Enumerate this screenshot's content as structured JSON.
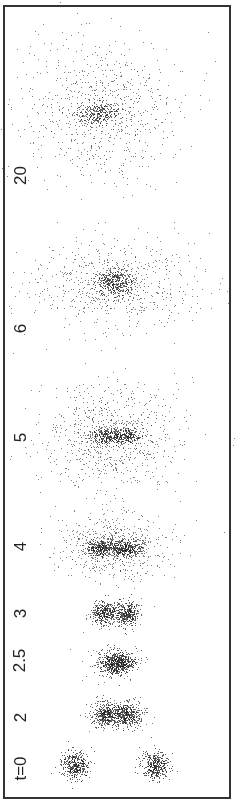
{
  "figure": {
    "frame_color": "#333333",
    "dot_color": "#1a1a1a"
  },
  "chart_data": {
    "type": "scatter",
    "title": "",
    "xlabel": "",
    "ylabel": "",
    "grid": false,
    "panels": [
      {
        "label": "t=0",
        "label_pos": [
          20,
          768
        ],
        "blobs": [
          {
            "cx": 75,
            "cy": 765,
            "sx": 7,
            "sy": 7,
            "n": 380
          },
          {
            "cx": 155,
            "cy": 765,
            "sx": 7,
            "sy": 7,
            "n": 380
          }
        ],
        "halo": {
          "cx": 115,
          "cy": 765,
          "sx": 8,
          "sy": 8,
          "n": 0
        }
      },
      {
        "label": "2",
        "label_pos": [
          20,
          717
        ],
        "blobs": [
          {
            "cx": 106,
            "cy": 714,
            "sx": 7,
            "sy": 6,
            "n": 380
          },
          {
            "cx": 126,
            "cy": 714,
            "sx": 7,
            "sy": 6,
            "n": 380
          }
        ],
        "halo": {
          "cx": 116,
          "cy": 714,
          "sx": 16,
          "sy": 9,
          "n": 60
        }
      },
      {
        "label": "2.5",
        "label_pos": [
          20,
          660
        ],
        "blobs": [
          {
            "cx": 116,
            "cy": 663,
            "sx": 9,
            "sy": 6,
            "n": 650
          }
        ],
        "halo": {
          "cx": 116,
          "cy": 663,
          "sx": 14,
          "sy": 9,
          "n": 60
        }
      },
      {
        "label": "3",
        "label_pos": [
          20,
          613
        ],
        "blobs": [
          {
            "cx": 104,
            "cy": 613,
            "sx": 6,
            "sy": 6,
            "n": 330
          },
          {
            "cx": 127,
            "cy": 613,
            "sx": 6,
            "sy": 6,
            "n": 330
          }
        ],
        "halo": {
          "cx": 116,
          "cy": 613,
          "sx": 16,
          "sy": 9,
          "n": 50
        }
      },
      {
        "label": "4",
        "label_pos": [
          20,
          546
        ],
        "blobs": [
          {
            "cx": 102,
            "cy": 548,
            "sx": 8,
            "sy": 4,
            "n": 300
          },
          {
            "cx": 125,
            "cy": 548,
            "sx": 8,
            "sy": 4,
            "n": 300
          }
        ],
        "halo": {
          "cx": 113,
          "cy": 546,
          "sx": 26,
          "sy": 15,
          "n": 650
        }
      },
      {
        "label": "5",
        "label_pos": [
          20,
          437
        ],
        "blobs": [
          {
            "cx": 106,
            "cy": 436,
            "sx": 8,
            "sy": 4,
            "n": 220
          },
          {
            "cx": 125,
            "cy": 436,
            "sx": 8,
            "sy": 4,
            "n": 220
          }
        ],
        "halo": {
          "cx": 112,
          "cy": 436,
          "sx": 34,
          "sy": 26,
          "n": 800
        }
      },
      {
        "label": "6",
        "label_pos": [
          20,
          328
        ],
        "blobs": [
          {
            "cx": 115,
            "cy": 283,
            "sx": 9,
            "sy": 7,
            "n": 350
          }
        ],
        "halo": {
          "cx": 112,
          "cy": 283,
          "sx": 42,
          "sy": 22,
          "n": 650
        }
      },
      {
        "label": "20",
        "label_pos": [
          20,
          175
        ],
        "blobs": [
          {
            "cx": 97,
            "cy": 113,
            "sx": 10,
            "sy": 6,
            "n": 260
          }
        ],
        "halo": {
          "cx": 100,
          "cy": 110,
          "sx": 38,
          "sy": 36,
          "n": 750
        }
      }
    ]
  }
}
